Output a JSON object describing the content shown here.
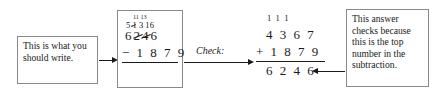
{
  "notes": {
    "left": "This is what you should write.",
    "right": "This answer checks because this is the top number in the subtraction."
  },
  "check_label": "Check:",
  "subtraction": {
    "regroup_top": "11 13",
    "regroup_mid": "5 1 3 16",
    "regroup_mid_digits": [
      "5",
      "1",
      "3",
      "16"
    ],
    "minuend": "6 2 4 6",
    "minuend_digits": [
      "6",
      "2",
      "4",
      "6"
    ],
    "operator": "−",
    "subtrahend": "1 8 7 9",
    "subtrahend_digits": [
      "1",
      "8",
      "7",
      "9"
    ]
  },
  "addition": {
    "carries": "1  1  1",
    "addend1": "4 3 6 7",
    "operator": "+",
    "addend2": "1 8 7 9",
    "sum": "6 2 4 6"
  },
  "colors": {
    "ink": "#1a1a1a",
    "box_border": "#8a8a8a",
    "background": "#ffffff"
  }
}
